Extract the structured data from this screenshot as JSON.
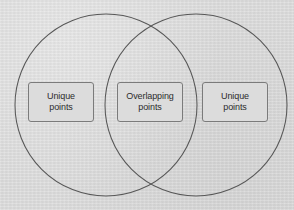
{
  "diagram": {
    "type": "venn-diagram",
    "title": "",
    "background_color": "#dadada",
    "circle_stroke_color": "#575757",
    "box_border_color": "#7b7b7b",
    "box_fill_color": "#dcdcdc",
    "text_color": "#2c2c2c",
    "circles": [
      {
        "name": "left-set",
        "cx": 106,
        "cy": 105,
        "r": 91
      },
      {
        "name": "right-set",
        "cx": 196,
        "cy": 105,
        "r": 91
      }
    ],
    "regions": {
      "left_label": "Unique\npoints",
      "center_label": "Overlapping\npoints",
      "right_label": "Unique\npoints"
    }
  }
}
